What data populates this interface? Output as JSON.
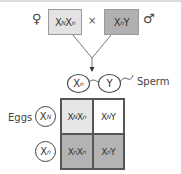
{
  "cross": {
    "female_symbol": "♀",
    "male_symbol": "♂",
    "times": "×",
    "female_parent": {
      "base": "X",
      "sup1": "N",
      "mid": "X",
      "sup2": "n",
      "color": "#e3e3e3"
    },
    "male_parent": {
      "base": "X",
      "sup1": "n",
      "mid": "Y",
      "color": "#b0b0b0"
    }
  },
  "sperm": {
    "label": "Sperm",
    "gametes": [
      {
        "base": "X",
        "sup": "n"
      },
      {
        "base": "Y",
        "sup": ""
      }
    ]
  },
  "eggs": {
    "label": "Eggs",
    "gametes": [
      {
        "base": "X",
        "sup": "N"
      },
      {
        "base": "X",
        "sup": "n"
      }
    ]
  },
  "punnett": {
    "cells": [
      {
        "a": "X",
        "as": "N",
        "b": "X",
        "bs": "n",
        "color": "#e6e6e6"
      },
      {
        "a": "X",
        "as": "N",
        "b": "Y",
        "bs": "",
        "color": "#ffffff"
      },
      {
        "a": "X",
        "as": "n",
        "b": "X",
        "bs": "n",
        "color": "#b3b3b3"
      },
      {
        "a": "X",
        "as": "n",
        "b": "Y",
        "bs": "",
        "color": "#b3b3b3"
      }
    ]
  }
}
